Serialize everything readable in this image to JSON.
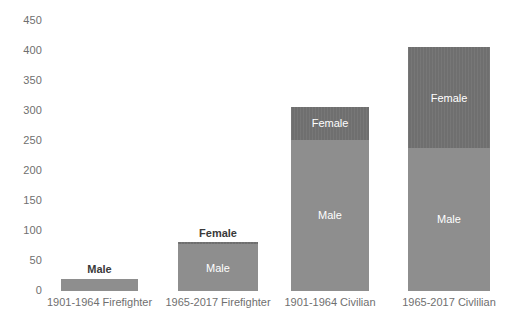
{
  "chart_data": {
    "type": "bar",
    "subtype": "stacked-column",
    "title": "",
    "xlabel": "",
    "ylabel": "",
    "ylim": [
      0,
      450
    ],
    "ytick_step": 50,
    "yticks": [
      "0",
      "50",
      "100",
      "150",
      "200",
      "250",
      "300",
      "350",
      "400",
      "450"
    ],
    "grid": false,
    "legend": false,
    "data_labels_inside_segments": true,
    "categories": [
      "1901-1964 Firefighter",
      "1965-2017 Firefighter",
      "1901-1964 Civilian",
      "1965-2017 Civlilian"
    ],
    "series": [
      {
        "name": "Male",
        "color": "#8e8e8e",
        "values": [
          20,
          78,
          252,
          239
        ]
      },
      {
        "name": "Female",
        "color": "#6f6f6f",
        "values": [
          0,
          3,
          55,
          167
        ]
      }
    ],
    "totals": [
      20,
      81,
      307,
      406
    ],
    "segment_labels": [
      [
        {
          "series": "Male",
          "text": "Male",
          "placement": "above-bar"
        },
        {
          "series": "Female",
          "text": "",
          "placement": "hidden"
        }
      ],
      [
        {
          "series": "Male",
          "text": "Male",
          "placement": "inside"
        },
        {
          "series": "Female",
          "text": "Female",
          "placement": "above-bar"
        }
      ],
      [
        {
          "series": "Male",
          "text": "Male",
          "placement": "inside"
        },
        {
          "series": "Female",
          "text": "Female",
          "placement": "inside"
        }
      ],
      [
        {
          "series": "Male",
          "text": "Male",
          "placement": "inside"
        },
        {
          "series": "Female",
          "text": "Female",
          "placement": "inside"
        }
      ]
    ]
  },
  "axis": {
    "y_tick_labels": [
      {
        "value": "450"
      },
      {
        "value": "400"
      },
      {
        "value": "350"
      },
      {
        "value": "300"
      },
      {
        "value": "250"
      },
      {
        "value": "200"
      },
      {
        "value": "150"
      },
      {
        "value": "100"
      },
      {
        "value": "50"
      },
      {
        "value": "0"
      }
    ]
  },
  "colors": {
    "male": "#8e8e8e",
    "female": "#6f6f6f",
    "axis_text": "#6f6f6f",
    "outside_label_text": "#3a3a3a",
    "inside_label_text": "#ffffff",
    "background": "#ffffff"
  }
}
